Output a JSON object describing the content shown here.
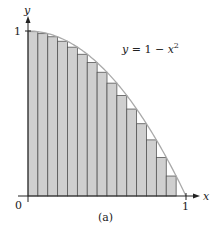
{
  "chart_data": {
    "type": "bar",
    "title": "",
    "caption": "(a)",
    "function_label": "y = 1 − x²",
    "xlabel": "x",
    "ylabel": "y",
    "xlim": [
      0,
      1
    ],
    "ylim": [
      0,
      1
    ],
    "x_ticks": [
      "0",
      "1"
    ],
    "y_ticks": [
      "1"
    ],
    "n_rectangles": 16,
    "rule": "right-endpoint",
    "x": [
      0.0625,
      0.125,
      0.1875,
      0.25,
      0.3125,
      0.375,
      0.4375,
      0.5,
      0.5625,
      0.625,
      0.6875,
      0.75,
      0.8125,
      0.875,
      0.9375,
      1.0
    ],
    "values": [
      0.996,
      0.984,
      0.965,
      0.938,
      0.902,
      0.859,
      0.809,
      0.75,
      0.684,
      0.609,
      0.527,
      0.438,
      0.34,
      0.234,
      0.121,
      0.0
    ],
    "colors": {
      "bar_fill": "#cfcfcf",
      "bar_edge": "#555555",
      "curve": "#aaaaaa",
      "axis": "#222222"
    }
  },
  "labels": {
    "origin": "0",
    "x_one": "1",
    "y_one": "1",
    "x_axis": "x",
    "y_axis": "y",
    "curve_eq_prefix": "y = 1 − x",
    "curve_eq_exp": "2",
    "caption": "(a)"
  }
}
